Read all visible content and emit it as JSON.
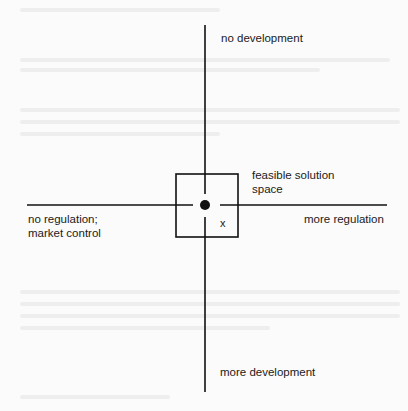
{
  "diagram": {
    "type": "axes-with-feasible-region",
    "colors": {
      "line": "#111111",
      "text": "#1a1a1a",
      "background": "#fbfbfb"
    },
    "vertical_axis": {
      "top_label": "no development",
      "bottom_label": "more development"
    },
    "horizontal_axis": {
      "left_label": "no regulation;\nmarket control",
      "right_label": "more regulation"
    },
    "region": {
      "label": "feasible solution\nspace"
    },
    "center_point": {
      "marker": "filled-dot"
    },
    "point_x_label": "x"
  }
}
